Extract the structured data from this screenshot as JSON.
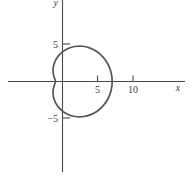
{
  "chart_data": {
    "type": "line",
    "title": "",
    "subtitle": "",
    "xlabel": "x",
    "ylabel": "y",
    "grid": false,
    "legend": null,
    "xlim": [
      -7.6,
      17.3
    ],
    "ylim": [
      -13.5,
      11.4
    ],
    "x_ticks": [
      {
        "value": 5,
        "label": "5"
      },
      {
        "value": 10,
        "label": "10"
      }
    ],
    "y_ticks": [
      {
        "value": 5,
        "label": "5"
      },
      {
        "value": -5,
        "label": "−5"
      }
    ],
    "axes": {
      "x_axis_at_y": 0,
      "y_axis_at_x": 0,
      "x_axis_extent": [
        -7.6,
        17.3
      ],
      "y_axis_extent": [
        -12.5,
        11.4
      ]
    },
    "series": [
      {
        "name": "limacon",
        "kind": "polar-closed-curve",
        "equation": "r = 4 + 3 cos(theta)",
        "closed": true,
        "x_range": [
          -2.0,
          7.0
        ],
        "y_range": [
          -5.7,
          5.7
        ],
        "points_polar": [
          {
            "theta_deg": 0,
            "r": 7.0
          },
          {
            "theta_deg": 10,
            "r": 6.95
          },
          {
            "theta_deg": 20,
            "r": 6.82
          },
          {
            "theta_deg": 30,
            "r": 6.6
          },
          {
            "theta_deg": 40,
            "r": 6.3
          },
          {
            "theta_deg": 50,
            "r": 5.93
          },
          {
            "theta_deg": 60,
            "r": 5.5
          },
          {
            "theta_deg": 70,
            "r": 5.03
          },
          {
            "theta_deg": 80,
            "r": 4.52
          },
          {
            "theta_deg": 90,
            "r": 4.0
          },
          {
            "theta_deg": 100,
            "r": 3.48
          },
          {
            "theta_deg": 110,
            "r": 2.97
          },
          {
            "theta_deg": 120,
            "r": 2.5
          },
          {
            "theta_deg": 130,
            "r": 2.07
          },
          {
            "theta_deg": 140,
            "r": 1.7
          },
          {
            "theta_deg": 150,
            "r": 1.4
          },
          {
            "theta_deg": 160,
            "r": 1.18
          },
          {
            "theta_deg": 170,
            "r": 1.05
          },
          {
            "theta_deg": 180,
            "r": 1.0
          },
          {
            "theta_deg": 190,
            "r": 1.05
          },
          {
            "theta_deg": 200,
            "r": 1.18
          },
          {
            "theta_deg": 210,
            "r": 1.4
          },
          {
            "theta_deg": 220,
            "r": 1.7
          },
          {
            "theta_deg": 230,
            "r": 2.07
          },
          {
            "theta_deg": 240,
            "r": 2.5
          },
          {
            "theta_deg": 250,
            "r": 2.97
          },
          {
            "theta_deg": 260,
            "r": 3.48
          },
          {
            "theta_deg": 270,
            "r": 4.0
          },
          {
            "theta_deg": 280,
            "r": 4.52
          },
          {
            "theta_deg": 290,
            "r": 5.03
          },
          {
            "theta_deg": 300,
            "r": 5.5
          },
          {
            "theta_deg": 310,
            "r": 5.93
          },
          {
            "theta_deg": 320,
            "r": 6.3
          },
          {
            "theta_deg": 330,
            "r": 6.6
          },
          {
            "theta_deg": 340,
            "r": 6.82
          },
          {
            "theta_deg": 350,
            "r": 6.95
          }
        ]
      }
    ],
    "colors": {
      "background": "#ffffff",
      "axis": "#4a4a4a",
      "curve": "#58545a",
      "text": "#3b3b3b"
    }
  }
}
